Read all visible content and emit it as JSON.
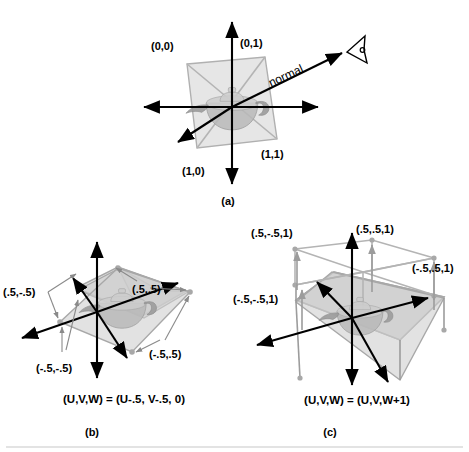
{
  "figure": {
    "caption_a": "(a)",
    "caption_b": "(b)",
    "caption_c": "(c)"
  },
  "panel_a": {
    "name": "unit-square-plane-with-normal",
    "corner_labels": {
      "top_left": "(0,0)",
      "top_right": "(0,1)",
      "bottom_right": "(1,1)",
      "bottom_left": "(1,0)"
    },
    "normal_label": "normal",
    "viewer_icon": "eye-icon"
  },
  "panel_b": {
    "name": "centered-plane",
    "corner_labels": {
      "back_left": "(.5,-.5)",
      "back_right": "(.5,.5)",
      "front_right": "(-.5,.5)",
      "front_left": "(-.5,-.5)"
    },
    "equation": "(U,V,W) = (U-.5, V-.5, 0)"
  },
  "panel_c": {
    "name": "translated-cube",
    "corner_labels": {
      "top_back_left": "(.5,-.5,1)",
      "top_back_right": "(.5,.5,1)",
      "top_front_right": "(-.5,.5,1)",
      "top_front_left": "(-.5,-.5,1)"
    },
    "equation": "(U,V,W) = (U,V,W+1)"
  },
  "colors": {
    "ink": "#000000",
    "geometry_gray": "#b4b4b4",
    "fill_gray": "#d2d2d2",
    "separator": "#c8c8c8"
  }
}
